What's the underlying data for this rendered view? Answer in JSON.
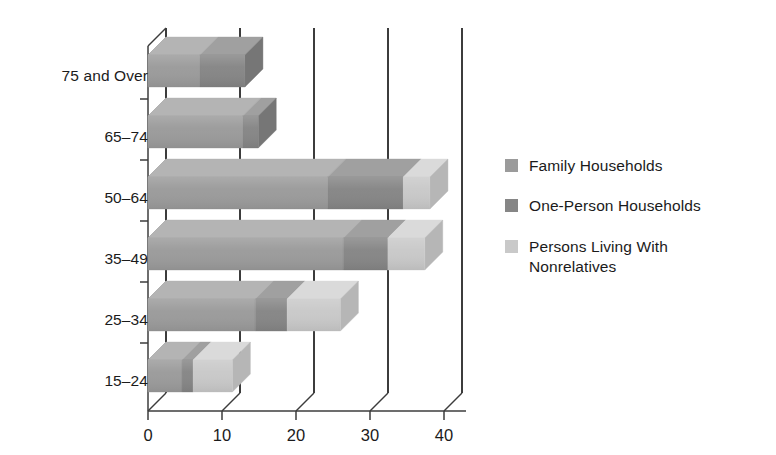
{
  "chart_data": {
    "type": "bar",
    "orientation": "horizontal",
    "stacked": true,
    "three_d": true,
    "title": "",
    "subtitle": "",
    "xlabel": "",
    "ylabel": "",
    "grid": true,
    "legend_position": "right",
    "xlim": [
      0,
      42
    ],
    "xticks": [
      0,
      10,
      20,
      30,
      40
    ],
    "xtick_labels": [
      "0",
      "10",
      "20",
      "30",
      "40"
    ],
    "categories": [
      "15–24",
      "25–34",
      "35–49",
      "50–64",
      "65–74",
      "75 and Over"
    ],
    "series": [
      {
        "name": "Family Households",
        "color": "#9b9b9b",
        "values": [
          4.6,
          14.5,
          26.4,
          24.3,
          12.8,
          7.0
        ]
      },
      {
        "name": "One-Person Households",
        "color": "#868686",
        "values": [
          1.5,
          4.3,
          6.0,
          10.2,
          2.1,
          6.1
        ]
      },
      {
        "name": "Persons Living With Nonrelatives",
        "color": "#c9c9c9",
        "values": [
          5.3,
          7.2,
          5.0,
          3.6,
          0.0,
          0.0
        ]
      }
    ],
    "totals": [
      11.4,
      26.0,
      37.4,
      38.1,
      14.9,
      13.1
    ]
  },
  "legend": {
    "items": [
      {
        "label": "Family Households",
        "swatch_color": "#9b9b9b"
      },
      {
        "label": "One-Person Households",
        "swatch_color": "#868686"
      },
      {
        "label": "Persons Living With Nonrelatives",
        "swatch_color": "#c9c9c9"
      }
    ]
  },
  "axis": {
    "y_categories": [
      "75 and Over",
      "65–74",
      "50–64",
      "35–49",
      "25–34",
      "15–24"
    ],
    "x_ticks": [
      "0",
      "10",
      "20",
      "30",
      "40"
    ]
  },
  "colors": {
    "background": "#ffffff",
    "axis_line": "#3c3c3c",
    "grid_line": "#3c3c3c",
    "text": "#1b1b1b",
    "family_front": "#9b9b9b",
    "family_top": "#b4b4b4",
    "family_side": "#8b8b8b",
    "one_person_front": "#868686",
    "one_person_top": "#a0a0a0",
    "one_person_side": "#767676",
    "nonrelatives_front": "#c9c9c9",
    "nonrelatives_top": "#dadada",
    "nonrelatives_side": "#b6b6b6"
  }
}
